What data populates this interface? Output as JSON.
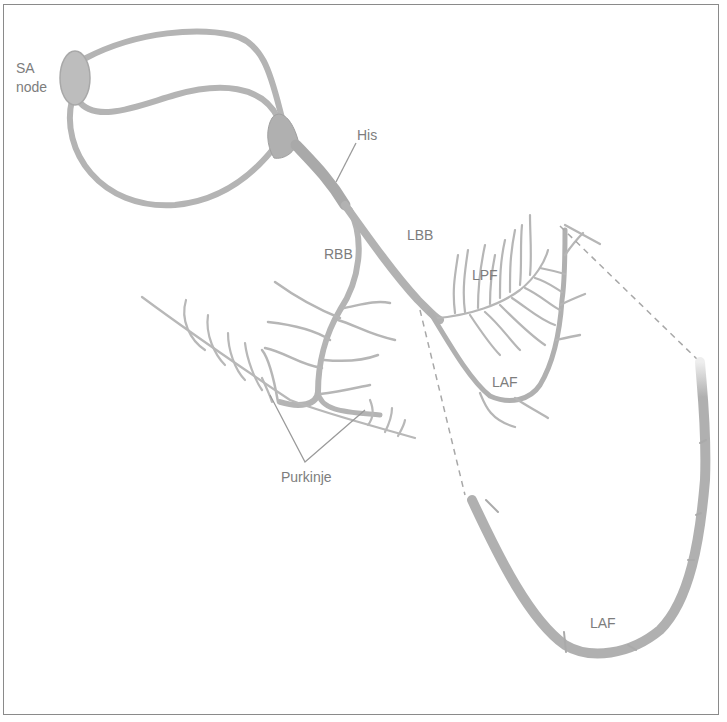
{
  "diagram": {
    "labels": {
      "sa_node_line1": "SA",
      "sa_node_line2": "node",
      "his": "His",
      "rbb": "RBB",
      "lbb": "LBB",
      "lpf": "LPF",
      "laf_upper": "LAF",
      "laf_lower": "LAF",
      "purkinje": "Purkinje"
    },
    "colors": {
      "fiber": "#b4b4b4",
      "fiber_dark": "#9e9e9e",
      "node": "#bdbdbd",
      "label": "#7d7d7d",
      "leader": "#9a9a9a",
      "border": "#8a8a8a"
    }
  }
}
